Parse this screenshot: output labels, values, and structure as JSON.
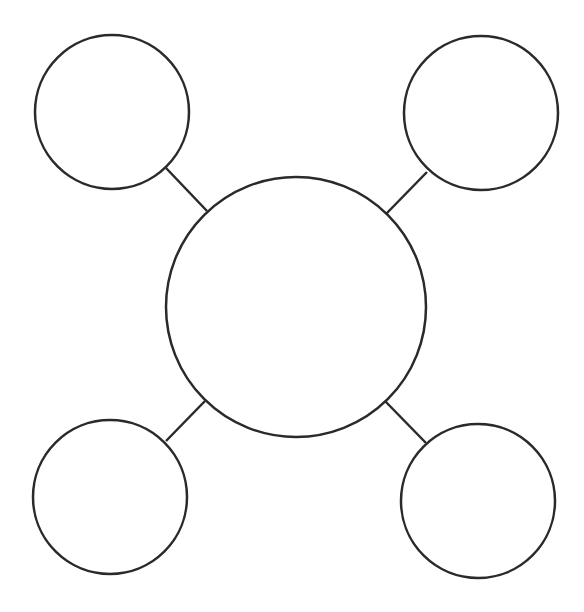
{
  "diagram": {
    "type": "concept-map",
    "stroke_color": "#2a2a2a",
    "background": "#ffffff",
    "central_node": {
      "id": "center",
      "cx": 296,
      "cy": 307,
      "r": 130,
      "label": ""
    },
    "outer_nodes": [
      {
        "id": "top-left",
        "cx": 112,
        "cy": 112,
        "r": 77,
        "label": ""
      },
      {
        "id": "top-right",
        "cx": 481,
        "cy": 113,
        "r": 77,
        "label": ""
      },
      {
        "id": "bottom-left",
        "cx": 110,
        "cy": 497,
        "r": 77,
        "label": ""
      },
      {
        "id": "bottom-right",
        "cx": 478,
        "cy": 501,
        "r": 77,
        "label": ""
      }
    ],
    "connectors": [
      {
        "from": "top-left",
        "to": "center",
        "x1": 166,
        "y1": 168,
        "x2": 207,
        "y2": 211
      },
      {
        "from": "top-right",
        "to": "center",
        "x1": 427,
        "y1": 172,
        "x2": 386,
        "y2": 214
      },
      {
        "from": "bottom-left",
        "to": "center",
        "x1": 166,
        "y1": 441,
        "x2": 205,
        "y2": 401
      },
      {
        "from": "bottom-right",
        "to": "center",
        "x1": 426,
        "y1": 443,
        "x2": 385,
        "y2": 401
      }
    ]
  }
}
